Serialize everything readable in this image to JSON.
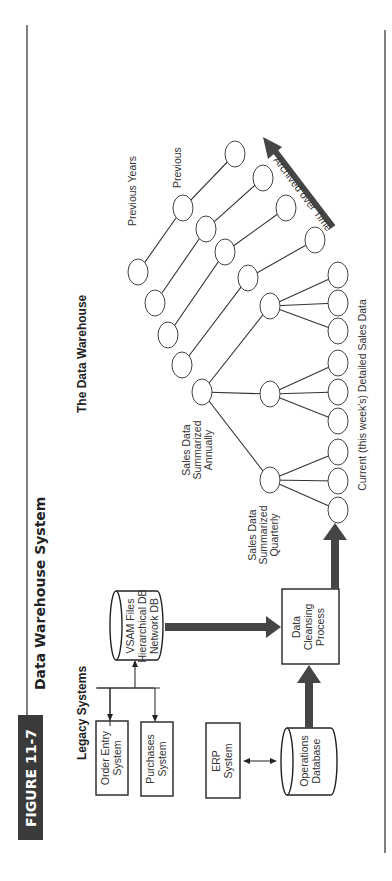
{
  "figure": {
    "badge": "FIGURE 11-7",
    "title": "Data Warehouse System"
  },
  "legacy": {
    "heading": "Legacy Systems",
    "order_entry": [
      "Order Entry",
      "System"
    ],
    "purchases": [
      "Purchases",
      "System"
    ],
    "vsam": [
      "VSAM Files",
      "Hierarchical DB",
      "Network DB"
    ],
    "erp": [
      "ERP",
      "System"
    ],
    "operations": [
      "Operations",
      "Database"
    ]
  },
  "process": {
    "cleansing": [
      "Data",
      "Cleansing",
      "Process"
    ]
  },
  "warehouse": {
    "heading": "The Data Warehouse",
    "quarterly_label": [
      "Sales Data",
      "Summarized",
      "Quarterly"
    ],
    "annual_label": [
      "Sales Data",
      "Summarized",
      "Annually"
    ],
    "previous_years_label": "Previous Years",
    "previous_label": "Previous",
    "archived_label": "Archived over Time",
    "current_label": "Current (this week's) Detailed Sales Data"
  },
  "colors": {
    "badge_bg": "#3a3a3a",
    "badge_text": "#ffffff",
    "arrow": "#454545",
    "line": "#333333"
  }
}
